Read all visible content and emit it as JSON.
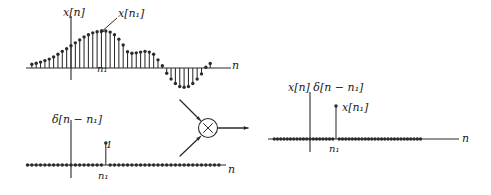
{
  "figure": {
    "title": "",
    "background": "#ffffff",
    "ink_color": "#2b2b2b",
    "operator": {
      "symbol": "×",
      "name": "multiplier",
      "inputs": 2,
      "outputs": 1
    }
  },
  "labels": {
    "signal_axis_label": "x[n]",
    "signal_peak_label": "x[n₁]",
    "signal_n_axis": "n",
    "signal_index_tick": "n₁",
    "impulse_axis_label": "δ[n − n₁]",
    "impulse_height": "1",
    "impulse_n_axis": "n",
    "impulse_index_tick": "n₁",
    "product_axis_label": "x[n] δ[n − n₁]",
    "product_peak_label": "x[n₁]",
    "product_n_axis": "n",
    "product_index_tick": "n₁"
  },
  "chart_data": [
    {
      "type": "stem",
      "name": "input-signal",
      "title": "x[n]",
      "xlabel": "n",
      "ylabel": "x[n]",
      "annotation": "x[n₁]",
      "marked_index": 8,
      "marked_index_label": "n₁",
      "x": [
        -9,
        -8,
        -7,
        -6,
        -5,
        -4,
        -3,
        -2,
        -1,
        0,
        1,
        2,
        3,
        4,
        5,
        6,
        7,
        8,
        9,
        10,
        11,
        12,
        13,
        14,
        15,
        16,
        17,
        18,
        19,
        20,
        21,
        22,
        23,
        24,
        25,
        26,
        27,
        28,
        29,
        30,
        31,
        32
      ],
      "values": [
        0.1,
        0.13,
        0.16,
        0.2,
        0.24,
        0.3,
        0.37,
        0.45,
        0.52,
        0.6,
        0.68,
        0.76,
        0.84,
        0.9,
        0.95,
        0.98,
        1.0,
        1.0,
        0.97,
        0.9,
        0.78,
        0.62,
        0.44,
        0.4,
        0.41,
        0.43,
        0.45,
        0.43,
        0.37,
        0.22,
        0.06,
        -0.14,
        -0.3,
        -0.42,
        -0.5,
        -0.52,
        -0.5,
        -0.42,
        -0.3,
        -0.16,
        0.02,
        0.12
      ],
      "ylim": [
        -0.65,
        1.15
      ],
      "grid": false
    },
    {
      "type": "stem",
      "name": "shifted-unit-impulse",
      "title": "δ[n − n₁]",
      "xlabel": "n",
      "ylabel": "δ[n − n₁]",
      "annotation": "1",
      "marked_index": 8,
      "marked_index_label": "n₁",
      "x": [
        -11,
        -10,
        -9,
        -8,
        -7,
        -6,
        -5,
        -4,
        -3,
        -2,
        -1,
        0,
        1,
        2,
        3,
        4,
        5,
        6,
        7,
        8,
        9,
        10,
        11,
        12,
        13,
        14,
        15,
        16,
        17,
        18,
        19,
        20,
        21,
        22,
        23,
        24,
        25,
        26,
        27,
        28,
        29,
        30,
        31,
        32,
        33,
        34
      ],
      "values": [
        0,
        0,
        0,
        0,
        0,
        0,
        0,
        0,
        0,
        0,
        0,
        0,
        0,
        0,
        0,
        0,
        0,
        0,
        0,
        1,
        0,
        0,
        0,
        0,
        0,
        0,
        0,
        0,
        0,
        0,
        0,
        0,
        0,
        0,
        0,
        0,
        0,
        0,
        0,
        0,
        0,
        0,
        0,
        0,
        0,
        0
      ],
      "ylim": [
        -0.18,
        1.25
      ],
      "grid": false
    },
    {
      "type": "stem",
      "name": "product-signal",
      "title": "x[n] δ[n − n₁]",
      "xlabel": "n",
      "ylabel": "x[n] δ[n − n₁]",
      "annotation": "x[n₁]",
      "marked_index": 8,
      "marked_index_label": "n₁",
      "x": [
        -11,
        -10,
        -9,
        -8,
        -7,
        -6,
        -5,
        -4,
        -3,
        -2,
        -1,
        0,
        1,
        2,
        3,
        4,
        5,
        6,
        7,
        8,
        9,
        10,
        11,
        12,
        13,
        14,
        15,
        16,
        17,
        18,
        19,
        20,
        21,
        22,
        23,
        24,
        25,
        26,
        27,
        28,
        29,
        30,
        31,
        32,
        33,
        34
      ],
      "values": [
        0,
        0,
        0,
        0,
        0,
        0,
        0,
        0,
        0,
        0,
        0,
        0,
        0,
        0,
        0,
        0,
        0,
        0,
        0,
        1,
        0,
        0,
        0,
        0,
        0,
        0,
        0,
        0,
        0,
        0,
        0,
        0,
        0,
        0,
        0,
        0,
        0,
        0,
        0,
        0,
        0,
        0,
        0,
        0,
        0,
        0
      ],
      "ylim": [
        -0.18,
        1.25
      ],
      "grid": false
    }
  ]
}
